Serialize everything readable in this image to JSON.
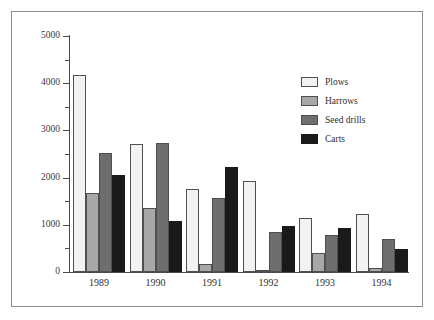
{
  "page": {
    "background": "#ffffff",
    "scan_remnant_text": "· · ·  ·    ·          ·"
  },
  "figure": {
    "frame_border_color": "#8e8e90"
  },
  "legend": {
    "position": "top-right-inside",
    "entries": [
      {
        "label": "Plows",
        "color": "#f2f2f0",
        "swatch": "legend-swatch-plows"
      },
      {
        "label": "Harrows",
        "color": "#a8a8a8",
        "swatch": "legend-swatch-harrows"
      },
      {
        "label": "Seed drills",
        "color": "#6e6e6e",
        "swatch": "legend-swatch-seed-drills"
      },
      {
        "label": "Carts",
        "color": "#1a1a1a",
        "swatch": "legend-swatch-carts"
      }
    ]
  },
  "axes": {
    "y_major_ticks": [
      "0",
      "1000",
      "2000",
      "3000",
      "4000",
      "5000"
    ],
    "y_minor_ticks": [
      "500",
      "1500",
      "2500",
      "3500",
      "4500"
    ],
    "x_ticks": [
      "1989",
      "1990",
      "1991",
      "1992",
      "1993",
      "1994"
    ]
  },
  "chart_data": {
    "type": "bar",
    "title": "",
    "xlabel": "",
    "ylabel": "",
    "ylim": [
      0,
      5000
    ],
    "ytick_interval": 1000,
    "yminor_interval": 500,
    "grid": false,
    "legend_position": "upper right",
    "categories": [
      "1989",
      "1990",
      "1991",
      "1992",
      "1993",
      "1994"
    ],
    "series": [
      {
        "name": "Plows",
        "color": "#f2f2f0",
        "values": [
          4180,
          2720,
          1760,
          1930,
          1140,
          1220
        ]
      },
      {
        "name": "Harrows",
        "color": "#a8a8a8",
        "values": [
          1680,
          1350,
          180,
          30,
          400,
          80
        ]
      },
      {
        "name": "Seed drills",
        "color": "#6e6e6e",
        "values": [
          2520,
          2740,
          1570,
          840,
          780,
          700
        ]
      },
      {
        "name": "Carts",
        "color": "#1a1a1a",
        "values": [
          2050,
          1080,
          2220,
          980,
          940,
          480
        ]
      }
    ]
  }
}
